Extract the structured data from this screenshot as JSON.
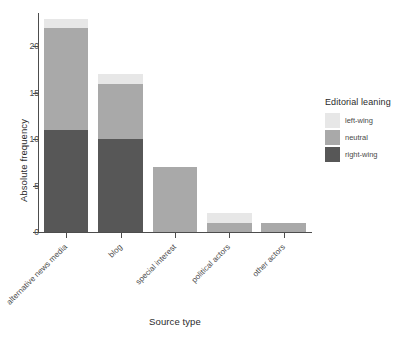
{
  "chart_data": {
    "type": "bar",
    "barmode": "stacked",
    "title": "",
    "xlabel": "Source type",
    "ylabel": "Absolute frequency",
    "categories": [
      "alternative news media",
      "blog",
      "special interest",
      "political actors",
      "other actors"
    ],
    "series": [
      {
        "name": "right-wing",
        "color": "#575757",
        "values": [
          11,
          10,
          0,
          0,
          0
        ]
      },
      {
        "name": "neutral",
        "color": "#a9a9a9",
        "values": [
          11,
          6,
          7,
          1,
          1
        ]
      },
      {
        "name": "left-wing",
        "color": "#e7e7e7",
        "values": [
          1,
          1,
          0,
          1,
          0
        ]
      }
    ],
    "stack_order_bottom_to_top": [
      "right-wing",
      "neutral",
      "left-wing"
    ],
    "totals": [
      23,
      17,
      7,
      2,
      1
    ],
    "ylim": [
      0,
      23.5
    ],
    "yticks": [
      0,
      5,
      10,
      15,
      20
    ],
    "ytick_labels": [
      "0",
      "5",
      "10",
      "15",
      "20"
    ],
    "grid": false,
    "legend": {
      "title": "Editorial leaning",
      "position": "right",
      "entries": [
        {
          "label": "left-wing",
          "color": "#e7e7e7"
        },
        {
          "label": "neutral",
          "color": "#a9a9a9"
        },
        {
          "label": "right-wing",
          "color": "#575757"
        }
      ]
    },
    "panel_background": "#ffffff",
    "axis_color": "#4d4d4d"
  }
}
